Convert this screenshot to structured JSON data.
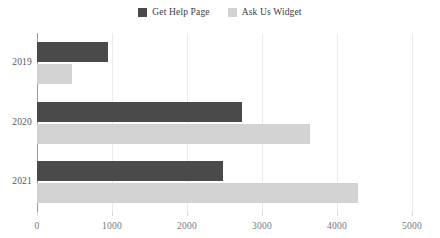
{
  "chart_data": {
    "type": "bar",
    "orientation": "horizontal",
    "title": "",
    "subtitle": "",
    "xlabel": "",
    "ylabel": "",
    "categories": [
      "2019",
      "2020",
      "2021"
    ],
    "series": [
      {
        "name": "Get Help Page",
        "color": "#4a4a4a",
        "values": [
          950,
          2730,
          2480
        ]
      },
      {
        "name": "Ask Us Widget",
        "color": "#d2d2d2",
        "values": [
          470,
          3640,
          4280
        ]
      }
    ],
    "xlim": [
      0,
      5000
    ],
    "xticks": [
      0,
      1000,
      2000,
      3000,
      4000,
      5000
    ],
    "xtick_labels": [
      "0",
      "1000",
      "2000",
      "3000",
      "4000",
      "5000"
    ],
    "grid": true,
    "grid_axis": "x",
    "legend": {
      "position": "top-center",
      "entries": [
        {
          "label": "Get Help Page",
          "color": "#4a4a4a",
          "swatch": "legend-swatch-get-help-page"
        },
        {
          "label": "Ask Us Widget",
          "color": "#d2d2d2",
          "swatch": "legend-swatch-ask-us-widget"
        }
      ]
    },
    "colors": {
      "background": "#ffffff",
      "gridline": "#eaeaea",
      "axis_line": "#9a9a9a",
      "tick_label": "#777777",
      "category_label": "#555555",
      "legend_label": "#3c3c3c"
    }
  }
}
